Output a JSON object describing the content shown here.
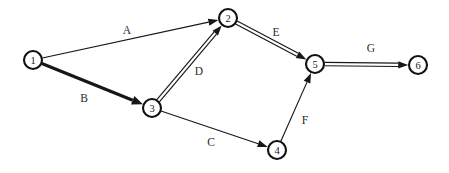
{
  "diagram": {
    "kind": "activity-on-arrow-network",
    "canvas": {
      "width": 449,
      "height": 173,
      "background": "#ffffff"
    },
    "ink_color": "#171717",
    "node_fill": "#ffffff",
    "nodes": [
      {
        "id": "1",
        "label": "1",
        "cx": 33,
        "cy": 60,
        "r": 9
      },
      {
        "id": "2",
        "label": "2",
        "cx": 228,
        "cy": 18,
        "r": 9
      },
      {
        "id": "3",
        "label": "3",
        "cx": 152,
        "cy": 108,
        "r": 9
      },
      {
        "id": "4",
        "label": "4",
        "cx": 277,
        "cy": 150,
        "r": 9
      },
      {
        "id": "5",
        "label": "5",
        "cx": 315,
        "cy": 64,
        "r": 9
      },
      {
        "id": "6",
        "label": "6",
        "cx": 418,
        "cy": 65,
        "r": 9
      }
    ],
    "edges": [
      {
        "id": "A",
        "label": "A",
        "from": "1",
        "to": "2",
        "style": "thin",
        "label_x": 127,
        "label_y": 30
      },
      {
        "id": "B",
        "label": "B",
        "from": "1",
        "to": "3",
        "style": "thick",
        "label_x": 84,
        "label_y": 98
      },
      {
        "id": "C",
        "label": "C",
        "from": "3",
        "to": "4",
        "style": "thin",
        "label_x": 211,
        "label_y": 142
      },
      {
        "id": "D",
        "label": "D",
        "from": "3",
        "to": "2",
        "style": "double",
        "label_x": 199,
        "label_y": 71
      },
      {
        "id": "E",
        "label": "E",
        "from": "2",
        "to": "5",
        "style": "double",
        "label_x": 276,
        "label_y": 32
      },
      {
        "id": "F",
        "label": "F",
        "from": "4",
        "to": "5",
        "style": "thin",
        "label_x": 305,
        "label_y": 120
      },
      {
        "id": "G",
        "label": "G",
        "from": "5",
        "to": "6",
        "style": "double",
        "label_x": 371,
        "label_y": 48
      }
    ]
  }
}
